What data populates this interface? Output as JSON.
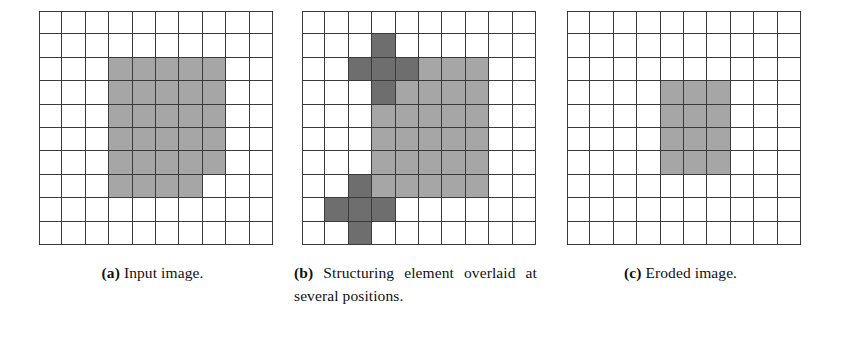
{
  "figure": {
    "grid_size": {
      "rows": 10,
      "cols": 10
    },
    "colors": {
      "light_gray": "#a6a6a6",
      "dark_gray": "#6e6e6e",
      "grid_line": "#3b3b3b",
      "background": "#ffffff"
    }
  },
  "panels": [
    {
      "id": "a",
      "tag": "(a)",
      "caption": "Input image.",
      "cells": [
        [
          "w",
          "w",
          "w",
          "w",
          "w",
          "w",
          "w",
          "w",
          "w",
          "w"
        ],
        [
          "w",
          "w",
          "w",
          "w",
          "w",
          "w",
          "w",
          "w",
          "w",
          "w"
        ],
        [
          "w",
          "w",
          "w",
          "l",
          "l",
          "l",
          "l",
          "l",
          "w",
          "w"
        ],
        [
          "w",
          "w",
          "w",
          "l",
          "l",
          "l",
          "l",
          "l",
          "w",
          "w"
        ],
        [
          "w",
          "w",
          "w",
          "l",
          "l",
          "l",
          "l",
          "l",
          "w",
          "w"
        ],
        [
          "w",
          "w",
          "w",
          "l",
          "l",
          "l",
          "l",
          "l",
          "w",
          "w"
        ],
        [
          "w",
          "w",
          "w",
          "l",
          "l",
          "l",
          "l",
          "l",
          "w",
          "w"
        ],
        [
          "w",
          "w",
          "w",
          "l",
          "l",
          "l",
          "l",
          "w",
          "w",
          "w"
        ],
        [
          "w",
          "w",
          "w",
          "w",
          "w",
          "w",
          "w",
          "w",
          "w",
          "w"
        ],
        [
          "w",
          "w",
          "w",
          "w",
          "w",
          "w",
          "w",
          "w",
          "w",
          "w"
        ]
      ]
    },
    {
      "id": "b",
      "tag": "(b)",
      "caption": "Structuring element overlaid at several positions.",
      "cells": [
        [
          "w",
          "w",
          "w",
          "w",
          "w",
          "w",
          "w",
          "w",
          "w",
          "w"
        ],
        [
          "w",
          "w",
          "w",
          "d",
          "w",
          "w",
          "w",
          "w",
          "w",
          "w"
        ],
        [
          "w",
          "w",
          "d",
          "d",
          "d",
          "l",
          "l",
          "l",
          "w",
          "w"
        ],
        [
          "w",
          "w",
          "w",
          "d",
          "l",
          "l",
          "l",
          "l",
          "w",
          "w"
        ],
        [
          "w",
          "w",
          "w",
          "l",
          "l",
          "l",
          "l",
          "l",
          "w",
          "w"
        ],
        [
          "w",
          "w",
          "w",
          "l",
          "l",
          "l",
          "l",
          "l",
          "w",
          "w"
        ],
        [
          "w",
          "w",
          "w",
          "l",
          "l",
          "l",
          "l",
          "l",
          "w",
          "w"
        ],
        [
          "w",
          "w",
          "d",
          "l",
          "l",
          "l",
          "l",
          "l",
          "w",
          "w"
        ],
        [
          "w",
          "d",
          "d",
          "d",
          "w",
          "w",
          "w",
          "w",
          "w",
          "w"
        ],
        [
          "w",
          "w",
          "d",
          "w",
          "w",
          "w",
          "w",
          "w",
          "w",
          "w"
        ]
      ]
    },
    {
      "id": "c",
      "tag": "(c)",
      "caption": "Eroded image.",
      "cells": [
        [
          "w",
          "w",
          "w",
          "w",
          "w",
          "w",
          "w",
          "w",
          "w",
          "w"
        ],
        [
          "w",
          "w",
          "w",
          "w",
          "w",
          "w",
          "w",
          "w",
          "w",
          "w"
        ],
        [
          "w",
          "w",
          "w",
          "w",
          "w",
          "w",
          "w",
          "w",
          "w",
          "w"
        ],
        [
          "w",
          "w",
          "w",
          "w",
          "l",
          "l",
          "l",
          "w",
          "w",
          "w"
        ],
        [
          "w",
          "w",
          "w",
          "w",
          "l",
          "l",
          "l",
          "w",
          "w",
          "w"
        ],
        [
          "w",
          "w",
          "w",
          "w",
          "l",
          "l",
          "l",
          "w",
          "w",
          "w"
        ],
        [
          "w",
          "w",
          "w",
          "w",
          "l",
          "l",
          "l",
          "w",
          "w",
          "w"
        ],
        [
          "w",
          "w",
          "w",
          "w",
          "w",
          "w",
          "w",
          "w",
          "w",
          "w"
        ],
        [
          "w",
          "w",
          "w",
          "w",
          "w",
          "w",
          "w",
          "w",
          "w",
          "w"
        ],
        [
          "w",
          "w",
          "w",
          "w",
          "w",
          "w",
          "w",
          "w",
          "w",
          "w"
        ]
      ]
    }
  ]
}
